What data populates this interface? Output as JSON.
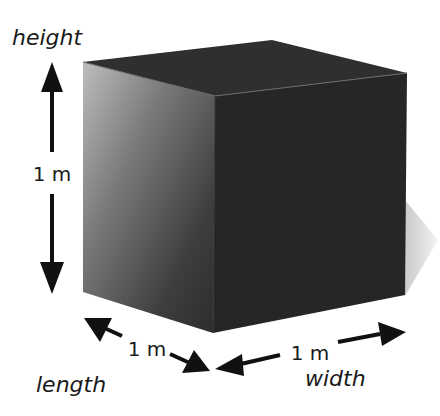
{
  "diagram": {
    "labels": {
      "height": "height",
      "length": "length",
      "width": "width"
    },
    "measurements": {
      "height": "1 m",
      "length": "1 m",
      "width": "1 m"
    },
    "colors": {
      "top_face": "#2f2f2f",
      "front_face": "#262626",
      "left_face_light": "#b5b5b5",
      "left_face_dark": "#303030",
      "arrow": "#111111",
      "shadow": "#c9c9c9",
      "background": "#ffffff"
    }
  }
}
